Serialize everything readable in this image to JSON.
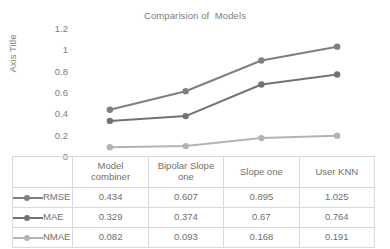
{
  "chart_data": {
    "type": "line",
    "title": "Comparision of  Models",
    "xlabel": "",
    "ylabel": "Axis Title",
    "categories": [
      "Model combiner",
      "Bipolar Slope one",
      "Slope one",
      "User KNN"
    ],
    "series": [
      {
        "name": "RMSE",
        "values": [
          0.434,
          0.607,
          0.895,
          1.025
        ],
        "color": "#7f7f7f"
      },
      {
        "name": "MAE",
        "values": [
          0.329,
          0.374,
          0.67,
          0.764
        ],
        "color": "#737373"
      },
      {
        "name": "NMAE",
        "values": [
          0.082,
          0.093,
          0.168,
          0.191
        ],
        "color": "#b3b3b3"
      }
    ],
    "ylim": [
      0,
      1.2
    ],
    "ytick_labels": [
      "1.2",
      "1",
      "0.8",
      "0.6",
      "0.4",
      "0.2",
      "0"
    ],
    "ytick_values": [
      1.2,
      1.0,
      0.8,
      0.6,
      0.4,
      0.2,
      0
    ],
    "grid": false,
    "legend_position": "data-table-left",
    "has_data_table": true
  },
  "table": {
    "header_cells": [
      {
        "line1": "",
        "line2": ""
      },
      {
        "line1": "Model",
        "line2": "combiner"
      },
      {
        "line1": "Bipolar Slope",
        "line2": "one"
      },
      {
        "line1": "Slope one",
        "line2": ""
      },
      {
        "line1": "User KNN",
        "line2": ""
      }
    ],
    "rows": [
      {
        "label": "RMSE",
        "cells": [
          "0.434",
          "0.607",
          "0.895",
          "1.025"
        ]
      },
      {
        "label": "MAE",
        "cells": [
          "0.329",
          "0.374",
          "0.67",
          "0.764"
        ]
      },
      {
        "label": "NMAE",
        "cells": [
          "0.082",
          "0.093",
          "0.168",
          "0.191"
        ]
      }
    ]
  },
  "colors": {
    "series_rmse": "#7f7f7f",
    "series_mae": "#737373",
    "series_nmae": "#b3b3b3",
    "text": "#7d7d7d",
    "table_border": "#d9d9d9",
    "background": "#ffffff"
  }
}
